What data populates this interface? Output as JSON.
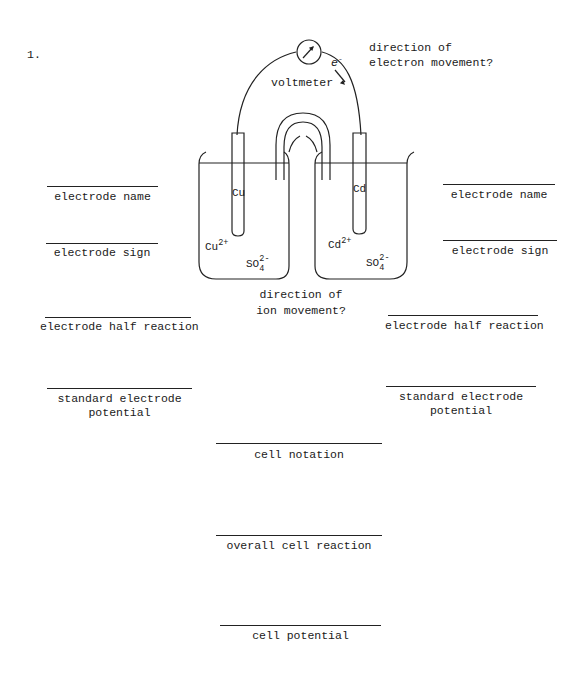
{
  "question_number": "1.",
  "diagram": {
    "instrument_label": "voltmeter",
    "electron_symbol": "e",
    "electron_superscript": "-",
    "electron_question_line1": "direction of",
    "electron_question_line2": "electron movement?",
    "ion_question_line1": "direction of",
    "ion_question_line2": "ion movement?",
    "left_cell": {
      "electrode": "Cu",
      "cation": "Cu",
      "cation_charge": "2+",
      "anion": "SO",
      "anion_subscript": "4",
      "anion_charge": "2-"
    },
    "right_cell": {
      "electrode": "Cd",
      "cation": "Cd",
      "cation_charge": "2+",
      "anion": "SO",
      "anion_subscript": "4",
      "anion_charge": "2-"
    }
  },
  "left_blanks": {
    "electrode_name": "electrode name",
    "electrode_sign": "electrode sign",
    "half_reaction": "electrode half reaction",
    "potential_line1": "standard electrode",
    "potential_line2": "potential"
  },
  "right_blanks": {
    "electrode_name": "electrode name",
    "electrode_sign": "electrode sign",
    "half_reaction": "electrode half reaction",
    "potential_line1": "standard electrode",
    "potential_line2": "potential"
  },
  "center_blanks": {
    "cell_notation": "cell notation",
    "overall_reaction": "overall cell reaction",
    "cell_potential": "cell potential"
  }
}
